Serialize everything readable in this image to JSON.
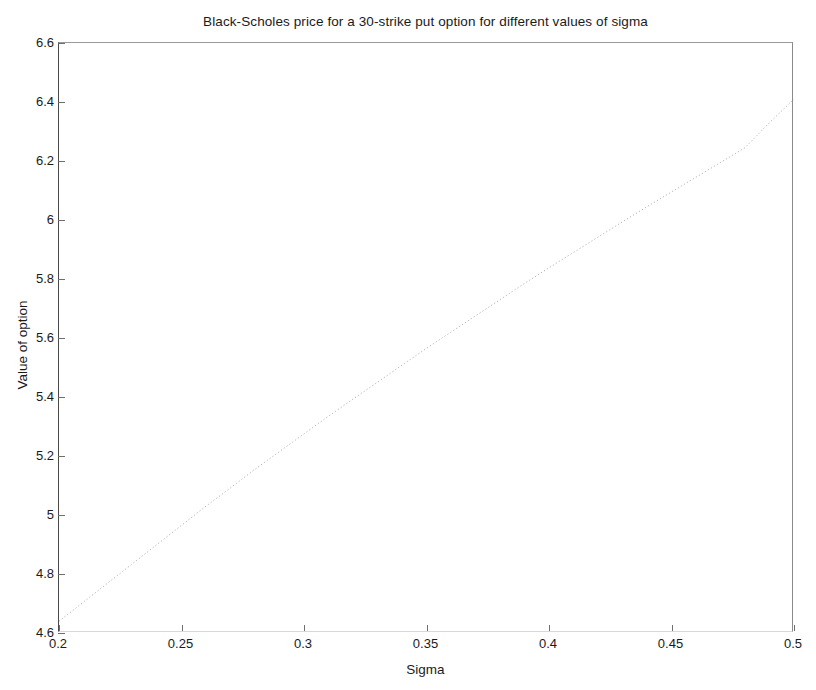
{
  "chart_data": {
    "type": "line",
    "title": "Black-Scholes price for a 30-strike put option for different values of sigma",
    "xlabel": "Sigma",
    "ylabel": "Value of option",
    "xlim": [
      0.2,
      0.5
    ],
    "ylim": [
      4.6,
      6.6
    ],
    "xticks": [
      0.2,
      0.25,
      0.3,
      0.35,
      0.4,
      0.45,
      0.5
    ],
    "xticklabels": [
      "0.2",
      "0.25",
      "0.3",
      "0.35",
      "0.4",
      "0.45",
      "0.5"
    ],
    "yticks": [
      4.6,
      4.8,
      5,
      5.2,
      5.4,
      5.6,
      5.8,
      6,
      6.2,
      6.4,
      6.6
    ],
    "yticklabels": [
      "4.6",
      "4.8",
      "5",
      "5.2",
      "5.4",
      "5.6",
      "5.8",
      "6",
      "6.2",
      "6.4",
      "6.6"
    ],
    "grid": false,
    "legend": false,
    "line_style": "dotted",
    "line_color": "#b4b4b4",
    "axis_color": "#6e6e6e",
    "background": "#ffffff",
    "series": [
      {
        "name": "Black-Scholes put price",
        "x": [
          0.2,
          0.21,
          0.22,
          0.23,
          0.24,
          0.25,
          0.26,
          0.27,
          0.28,
          0.29,
          0.3,
          0.31,
          0.32,
          0.33,
          0.34,
          0.35,
          0.36,
          0.37,
          0.38,
          0.39,
          0.4,
          0.41,
          0.42,
          0.43,
          0.44,
          0.45,
          0.46,
          0.47,
          0.48,
          0.49,
          0.5
        ],
        "y": [
          4.64,
          4.705,
          4.77,
          4.835,
          4.9,
          4.965,
          5.03,
          5.092,
          5.155,
          5.215,
          5.275,
          5.335,
          5.393,
          5.45,
          5.508,
          5.565,
          5.62,
          5.675,
          5.73,
          5.785,
          5.838,
          5.89,
          5.942,
          5.994,
          6.045,
          6.095,
          6.145,
          6.195,
          6.245,
          6.33,
          6.41
        ]
      }
    ]
  },
  "figure": {
    "plot_left": 58,
    "plot_top": 42,
    "plot_width": 735,
    "plot_height": 590
  }
}
